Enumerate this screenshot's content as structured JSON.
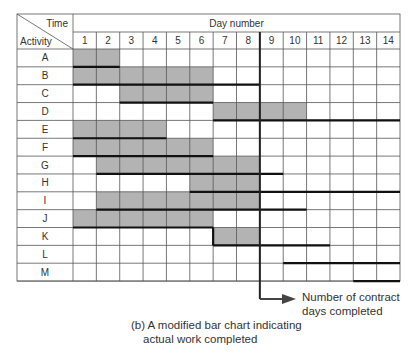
{
  "chart_data": {
    "type": "table",
    "subtype": "gantt-progress",
    "title": "(b) A modified bar chart indicating actual work completed",
    "caption_line1": "(b) A modified bar chart indicating",
    "caption_line2": "actual work completed",
    "header_time": "Time",
    "header_activity": "Activity",
    "xlabel": "Day number",
    "days": [
      "1",
      "2",
      "3",
      "4",
      "5",
      "6",
      "7",
      "8",
      "9",
      "10",
      "11",
      "12",
      "13",
      "14"
    ],
    "contract_days_completed": 8,
    "annotation_line1": "Number of contract",
    "annotation_line2": "days completed",
    "colors": {
      "shade": "#b3b3b3",
      "grid": "#555555",
      "bar": "#111111",
      "text": "#333333"
    },
    "activities": [
      {
        "name": "A",
        "actual": [
          1,
          2
        ],
        "planned": [
          1,
          2
        ]
      },
      {
        "name": "B",
        "actual": [
          1,
          6
        ],
        "planned": [
          1,
          8
        ]
      },
      {
        "name": "C",
        "actual": [
          3,
          6
        ],
        "planned": [
          3,
          6
        ]
      },
      {
        "name": "D",
        "actual": [
          7,
          10
        ],
        "planned": [
          7,
          14
        ]
      },
      {
        "name": "E",
        "actual": [
          1,
          4
        ],
        "planned": [
          1,
          4
        ]
      },
      {
        "name": "F",
        "actual": [
          1,
          6
        ],
        "planned": [
          1,
          6
        ]
      },
      {
        "name": "G",
        "actual": [
          2,
          8
        ],
        "planned": [
          2,
          9
        ]
      },
      {
        "name": "H",
        "actual": [
          6,
          8
        ],
        "planned": [
          6,
          14
        ]
      },
      {
        "name": "I",
        "actual": [
          2,
          8
        ],
        "planned": [
          2,
          10
        ]
      },
      {
        "name": "J",
        "actual": [
          1,
          6
        ],
        "planned": [
          1,
          6
        ]
      },
      {
        "name": "K",
        "actual": [
          7,
          8
        ],
        "planned": [
          7,
          11
        ]
      },
      {
        "name": "L",
        "actual": null,
        "planned": [
          10,
          14
        ]
      },
      {
        "name": "M",
        "actual": null,
        "planned": [
          13,
          14
        ]
      }
    ]
  }
}
